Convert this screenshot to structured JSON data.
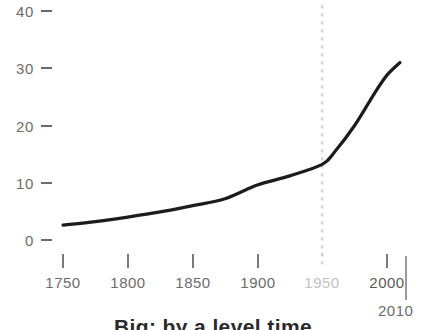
{
  "chart_data": {
    "type": "line",
    "title": "Big: by a level time",
    "xlabel": "",
    "ylabel": "",
    "xlim": [
      1750,
      2010
    ],
    "ylim": [
      0,
      40
    ],
    "grid": false,
    "legend": null,
    "x_ticks": [
      {
        "value": 1750,
        "label": "1750",
        "style": "normal"
      },
      {
        "value": 1800,
        "label": "1800",
        "style": "normal"
      },
      {
        "value": 1850,
        "label": "1850",
        "style": "normal"
      },
      {
        "value": 1900,
        "label": "1900",
        "style": "normal"
      },
      {
        "value": 1950,
        "label": "1950",
        "style": "dim"
      },
      {
        "value": 2000,
        "label": "2000",
        "style": "strong"
      }
    ],
    "y_ticks": [
      {
        "value": 0,
        "label": "0"
      },
      {
        "value": 10,
        "label": "10"
      },
      {
        "value": 20,
        "label": "20"
      },
      {
        "value": 30,
        "label": "30"
      },
      {
        "value": 40,
        "label": "40"
      }
    ],
    "end_marker": {
      "label": "2010",
      "value": 2010
    },
    "annotations": [
      {
        "type": "vline",
        "name": "1950-marker",
        "value": 1950,
        "style": "dashed",
        "color": "#d8d8d8"
      }
    ],
    "series": [
      {
        "name": "population",
        "color": "#1c1c1c",
        "x": [
          1750,
          1775,
          1800,
          1825,
          1850,
          1875,
          1900,
          1925,
          1950,
          1960,
          1975,
          1990,
          2000,
          2010
        ],
        "values": [
          2.6,
          3.2,
          4.0,
          4.9,
          6.0,
          7.2,
          9.6,
          11.2,
          13.2,
          15.5,
          20.0,
          25.5,
          28.8,
          31.0
        ]
      }
    ]
  },
  "colors": {
    "line": "#1c1c1c",
    "axis_text": "#6b6b6b",
    "axis_text_dim": "#c2c2c2",
    "marker_line": "#d8d8d8",
    "background": "#ffffff"
  }
}
